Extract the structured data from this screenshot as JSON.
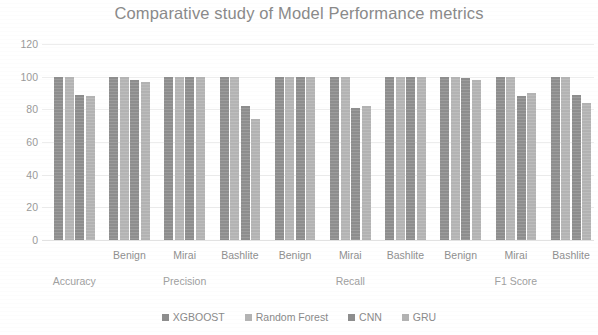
{
  "chart_data": {
    "type": "bar",
    "title": "Comparative study of Model Performance metrics",
    "xlabel": "",
    "ylabel": "",
    "ylim": [
      0,
      120
    ],
    "yticks": [
      0,
      20,
      40,
      60,
      80,
      100,
      120
    ],
    "grid": true,
    "legend_position": "bottom",
    "groups": [
      "Accuracy",
      "Precision",
      "Recall",
      "F1 Score"
    ],
    "categories": [
      {
        "group": "Accuracy",
        "sub": ""
      },
      {
        "group": "Precision",
        "sub": "Benign"
      },
      {
        "group": "Precision",
        "sub": "Mirai"
      },
      {
        "group": "Precision",
        "sub": "Bashlite"
      },
      {
        "group": "Recall",
        "sub": "Benign"
      },
      {
        "group": "Recall",
        "sub": "Mirai"
      },
      {
        "group": "Recall",
        "sub": "Bashlite"
      },
      {
        "group": "F1 Score",
        "sub": "Benign"
      },
      {
        "group": "F1 Score",
        "sub": "Mirai"
      },
      {
        "group": "F1 Score",
        "sub": "Bashlite"
      }
    ],
    "series": [
      {
        "name": "XGBOOST",
        "color": "#8e8e8e",
        "values": [
          100,
          100,
          100,
          100,
          100,
          100,
          100,
          100,
          100,
          100
        ]
      },
      {
        "name": "Random Forest",
        "color": "#b4b4b4",
        "values": [
          100,
          100,
          100,
          100,
          100,
          100,
          100,
          100,
          100,
          100
        ]
      },
      {
        "name": "CNN",
        "color": "#8e8e8e",
        "values": [
          89,
          98,
          100,
          82,
          100,
          81,
          100,
          99,
          88,
          89
        ]
      },
      {
        "name": "GRU",
        "color": "#b3b3b3",
        "values": [
          88,
          97,
          100,
          74,
          100,
          82,
          100,
          98,
          90,
          84
        ]
      }
    ]
  },
  "legend": {
    "items": [
      {
        "label": "XGBOOST"
      },
      {
        "label": "Random Forest"
      },
      {
        "label": "CNN"
      },
      {
        "label": "GRU"
      }
    ]
  }
}
